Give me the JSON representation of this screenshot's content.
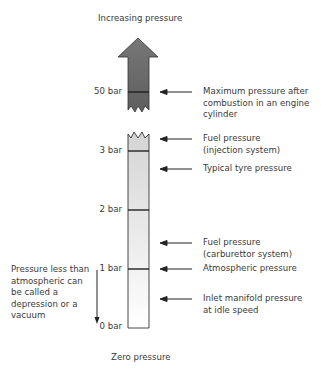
{
  "diagram": {
    "top_label": "Increasing pressure",
    "bottom_label": "Zero pressure",
    "scale_ticks": [
      {
        "label": "50 bar"
      },
      {
        "label": "3 bar"
      },
      {
        "label": "2 bar"
      },
      {
        "label": "1 bar"
      },
      {
        "label": "0 bar"
      }
    ],
    "annotations": [
      {
        "text": [
          "Maximum pressure after",
          "combustion in an engine",
          "cylinder"
        ]
      },
      {
        "text": [
          "Fuel pressure",
          "(injection system)"
        ]
      },
      {
        "text": [
          "Typical tyre pressure"
        ]
      },
      {
        "text": [
          "Fuel pressure",
          "(carburettor system)"
        ]
      },
      {
        "text": [
          "Atmospheric pressure"
        ]
      },
      {
        "text": [
          "Inlet manifold pressure",
          "at idle speed"
        ]
      }
    ],
    "side_note": [
      "Pressure less than",
      "atmospheric can",
      "be called a",
      "depression or a",
      "vacuum"
    ],
    "colors": {
      "upper_arrow": "#6e6e6e",
      "column_top": "#d6d6d6",
      "column_bottom": "#ffffff",
      "lines": "#222222"
    }
  }
}
